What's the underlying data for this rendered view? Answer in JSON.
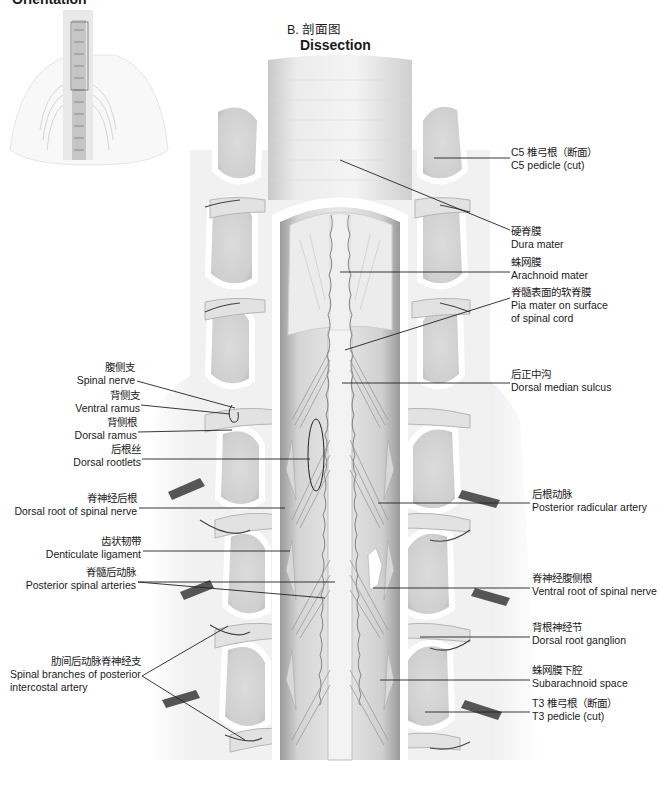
{
  "titles": {
    "orientation": "Orientation",
    "panel_b_zh": "B. 剖面图",
    "panel_b_en": "Dissection"
  },
  "labels_right": [
    {
      "zh": "C5 椎弓根（断面）",
      "en": "C5 pedicle (cut)"
    },
    {
      "zh": "硬脊膜",
      "en": "Dura mater"
    },
    {
      "zh": "蛛网膜",
      "en": "Arachnoid mater"
    },
    {
      "zh": "脊髓表面的软脊膜",
      "en": "Pia mater on surface",
      "en2": "of spinal cord"
    },
    {
      "zh": "后正中沟",
      "en": "Dorsal median sulcus"
    },
    {
      "zh": "后根动脉",
      "en": "Posterior radicular artery"
    },
    {
      "zh": "脊神经腹侧根",
      "en": "Ventral root of spinal nerve"
    },
    {
      "zh": "背根神经节",
      "en": "Dorsal root ganglion"
    },
    {
      "zh": "蛛网膜下腔",
      "en": "Subarachnoid space"
    },
    {
      "zh": "T3 椎弓根（断面）",
      "en": "T3 pedicle (cut)"
    }
  ],
  "labels_left": [
    {
      "zh": "腹侧支",
      "en": "Spinal nerve"
    },
    {
      "zh": "背侧支",
      "en": "Ventral ramus"
    },
    {
      "zh": "背侧根",
      "en": "Dorsal ramus"
    },
    {
      "zh": "后根丝",
      "en": "Dorsal rootlets"
    },
    {
      "zh": "脊神经后根",
      "en": "Dorsal root of spinal nerve"
    },
    {
      "zh": "齿状韧带",
      "en": "Denticulate ligament"
    },
    {
      "zh": "脊髓后动脉",
      "en": "Posterior spinal arteries"
    },
    {
      "zh": "肋间后动脉脊神经支",
      "en": "Spinal branches of posterior",
      "en2": "intercostal artery"
    }
  ]
}
